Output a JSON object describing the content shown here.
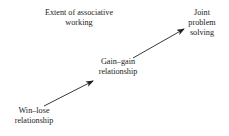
{
  "diagram": {
    "title": {
      "lines": [
        "Extent of associative",
        "working"
      ]
    },
    "nodes": [
      {
        "id": "win-lose",
        "lines": [
          "Win–lose",
          "relationship"
        ]
      },
      {
        "id": "gain-gain",
        "lines": [
          "Gain–gain",
          "relationship"
        ]
      },
      {
        "id": "joint",
        "lines": [
          "Joint",
          "problem",
          "solving"
        ]
      }
    ],
    "edges": [
      {
        "from": "win-lose",
        "to": "gain-gain",
        "x1": 44,
        "y1": 106,
        "x2": 93,
        "y2": 81
      },
      {
        "from": "gain-gain",
        "to": "joint",
        "x1": 133,
        "y1": 58,
        "x2": 184,
        "y2": 29
      }
    ],
    "colors": {
      "text": "#222222",
      "arrow": "#222222",
      "background": "#ffffff"
    }
  }
}
